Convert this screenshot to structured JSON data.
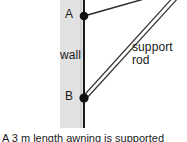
{
  "figure": {
    "type": "physics-statics-diagram",
    "width": 187,
    "height": 142,
    "background_color": "#ffffff",
    "wall": {
      "label": "wall",
      "fill_color": "#e2e2e2",
      "edge_color": "#1a1a1a",
      "band_left": 60,
      "band_right": 84,
      "band_top": 0,
      "band_bottom": 128
    },
    "points": [
      {
        "id": "A",
        "label": "A",
        "x": 84,
        "y": 16,
        "marker": "filled-circle",
        "color": "#111111"
      },
      {
        "id": "B",
        "label": "B",
        "x": 84,
        "y": 98,
        "marker": "filled-circle",
        "color": "#111111"
      }
    ],
    "members": [
      {
        "id": "beam",
        "style": "single-line",
        "from": {
          "x": 84,
          "y": 16
        },
        "to": {
          "x": 187,
          "y": -13
        },
        "color": "#262626"
      },
      {
        "id": "support-rod",
        "label": "support\nrod",
        "label_line1": "support",
        "label_line2": "rod",
        "style": "double-line",
        "from": {
          "x": 84,
          "y": 98
        },
        "to": {
          "x": 187,
          "y": -17
        },
        "color": "#333333"
      }
    ],
    "caption": "A 3 m length awning is supported"
  }
}
